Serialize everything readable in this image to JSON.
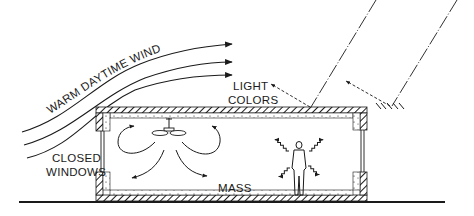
{
  "diagram": {
    "labels": {
      "wind": "WARM DAYTIME WIND",
      "light_colors_line1": "LIGHT",
      "light_colors_line2": "COLORS",
      "closed_windows_line1": "CLOSED",
      "closed_windows_line2": "WINDOWS",
      "mass": "MASS"
    },
    "elements": [
      "wind-arrows",
      "sun-rays",
      "reflected-light-arrows",
      "building-section-with-mass-walls",
      "ceiling-fan",
      "air-circulation-arrows",
      "occupant-figure",
      "radiant-heat-squiggles",
      "ground-line"
    ],
    "colors": {
      "ink": "#1a1a1a",
      "background": "#ffffff"
    }
  }
}
